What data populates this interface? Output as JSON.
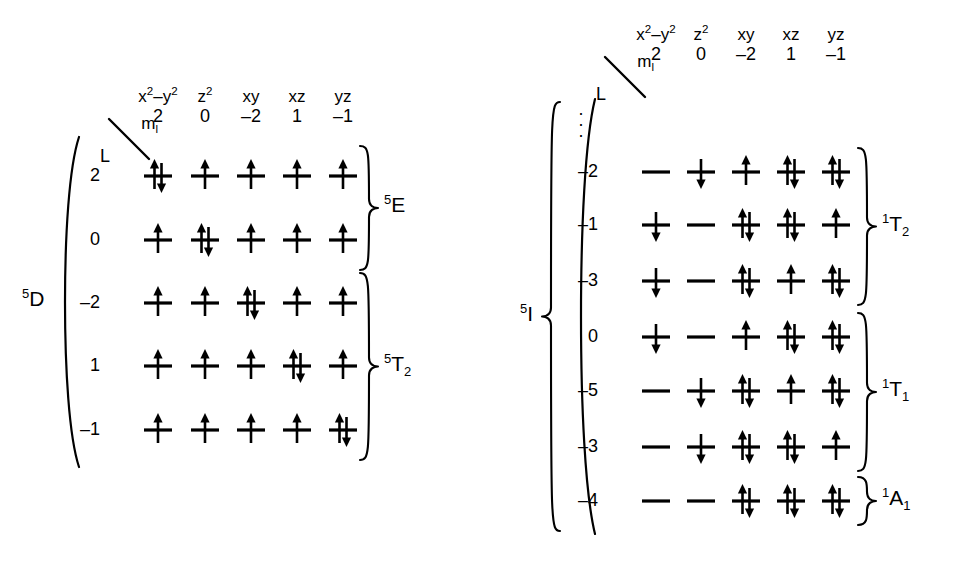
{
  "figure": {
    "ink_color": "#000000",
    "background": "#ffffff"
  },
  "columns": {
    "orbital_labels": [
      "x2–y2",
      "z2",
      "xy",
      "xz",
      "yz"
    ],
    "ml_header": "m",
    "ml_header_sub": "l",
    "l_header": "L",
    "ml_values": [
      "2",
      "0",
      "–2",
      "1",
      "–1"
    ]
  },
  "left_table": {
    "overall_term": "D",
    "overall_term_superscript": "5",
    "rows": [
      {
        "label": "2",
        "occupancy": [
          "ud",
          "u",
          "u",
          "u",
          "u"
        ]
      },
      {
        "label": "0",
        "occupancy": [
          "u",
          "ud",
          "u",
          "u",
          "u"
        ]
      },
      {
        "label": "–2",
        "occupancy": [
          "u",
          "u",
          "ud",
          "u",
          "u"
        ]
      },
      {
        "label": "1",
        "occupancy": [
          "u",
          "u",
          "u",
          "ud",
          "u"
        ]
      },
      {
        "label": "–1",
        "occupancy": [
          "u",
          "u",
          "u",
          "u",
          "ud"
        ]
      }
    ],
    "groups": [
      {
        "term": "E",
        "superscript": "5",
        "subscript": "",
        "row_start": 0,
        "row_end": 1
      },
      {
        "term": "T",
        "superscript": "5",
        "subscript": "2",
        "row_start": 2,
        "row_end": 4
      }
    ]
  },
  "right_table": {
    "overall_term": "I",
    "overall_term_superscript": "5",
    "ellipsis": "⋮",
    "rows": [
      {
        "label": "–2",
        "occupancy": [
          "e",
          "d",
          "u",
          "ud",
          "ud"
        ]
      },
      {
        "label": "–1",
        "occupancy": [
          "d",
          "e",
          "ud",
          "ud",
          "u"
        ]
      },
      {
        "label": "–3",
        "occupancy": [
          "d",
          "e",
          "ud",
          "u",
          "ud"
        ]
      },
      {
        "label": "0",
        "occupancy": [
          "d",
          "e",
          "u",
          "ud",
          "ud"
        ]
      },
      {
        "label": "–5",
        "occupancy": [
          "e",
          "d",
          "ud",
          "u",
          "ud"
        ]
      },
      {
        "label": "–3",
        "occupancy": [
          "e",
          "d",
          "ud",
          "ud",
          "u"
        ]
      },
      {
        "label": "–4",
        "occupancy": [
          "e",
          "e",
          "ud",
          "ud",
          "ud"
        ]
      }
    ],
    "groups": [
      {
        "term": "T",
        "superscript": "1",
        "subscript": "2",
        "row_start": 0,
        "row_end": 2
      },
      {
        "term": "T",
        "superscript": "1",
        "subscript": "1",
        "row_start": 3,
        "row_end": 5
      },
      {
        "term": "A",
        "superscript": "1",
        "subscript": "1",
        "row_start": 6,
        "row_end": 6
      }
    ]
  },
  "legend": {
    "occupancy_codes": {
      "u": "single spin-up electron",
      "d": "single spin-down electron",
      "ud": "spin-up and spin-down pair",
      "e": "empty orbital (horizontal line only)"
    }
  }
}
